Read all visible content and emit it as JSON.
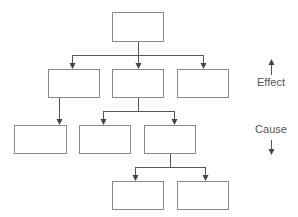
{
  "diagram": {
    "type": "hierarchy-tree",
    "nodes": [
      {
        "id": "root",
        "label": "",
        "x": 112,
        "y": 12,
        "w": 51,
        "h": 29
      },
      {
        "id": "l2a",
        "label": "",
        "x": 48,
        "y": 69,
        "w": 51,
        "h": 28
      },
      {
        "id": "l2b",
        "label": "",
        "x": 112,
        "y": 69,
        "w": 51,
        "h": 28
      },
      {
        "id": "l2c",
        "label": "",
        "x": 177,
        "y": 69,
        "w": 51,
        "h": 28
      },
      {
        "id": "l3a",
        "label": "",
        "x": 14,
        "y": 125,
        "w": 52,
        "h": 28
      },
      {
        "id": "l3b",
        "label": "",
        "x": 79,
        "y": 125,
        "w": 51,
        "h": 28
      },
      {
        "id": "l3c",
        "label": "",
        "x": 144,
        "y": 125,
        "w": 51,
        "h": 28
      },
      {
        "id": "l4a",
        "label": "",
        "x": 112,
        "y": 181,
        "w": 51,
        "h": 28
      },
      {
        "id": "l4b",
        "label": "",
        "x": 177,
        "y": 181,
        "w": 51,
        "h": 28
      }
    ],
    "edges": [
      {
        "from": "root",
        "to": "l2a"
      },
      {
        "from": "root",
        "to": "l2b"
      },
      {
        "from": "root",
        "to": "l2c"
      },
      {
        "from": "l2a",
        "to": "l3a"
      },
      {
        "from": "l2b",
        "to": "l3b"
      },
      {
        "from": "l2b",
        "to": "l3c"
      },
      {
        "from": "l3c",
        "to": "l4a"
      },
      {
        "from": "l3c",
        "to": "l4b"
      }
    ]
  },
  "legend": {
    "effect_label": "Effect",
    "cause_label": "Cause",
    "effect_direction": "up-arrow",
    "cause_direction": "down-arrow"
  },
  "colors": {
    "box_stroke": "#8a8a8a",
    "line": "#555555",
    "text": "#555555"
  }
}
